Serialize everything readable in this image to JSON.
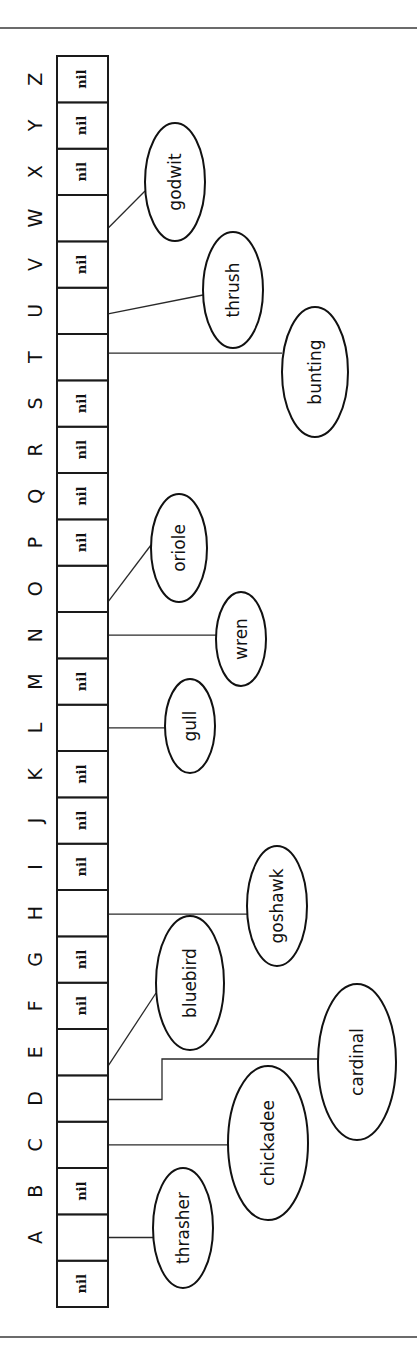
{
  "diagram": {
    "type": "hash-table-buckets",
    "orientation": "rotated-90-ccw",
    "colors": {
      "ink": "#111111",
      "background": "#ffffff"
    },
    "table": {
      "cells": [
        {
          "key": "",
          "value": "nil"
        },
        {
          "key": "A",
          "value": ""
        },
        {
          "key": "B",
          "value": "nil"
        },
        {
          "key": "C",
          "value": ""
        },
        {
          "key": "D",
          "value": ""
        },
        {
          "key": "E",
          "value": ""
        },
        {
          "key": "F",
          "value": "nil"
        },
        {
          "key": "G",
          "value": "nil"
        },
        {
          "key": "H",
          "value": ""
        },
        {
          "key": "I",
          "value": "nil"
        },
        {
          "key": "J",
          "value": "nil"
        },
        {
          "key": "K",
          "value": "nil"
        },
        {
          "key": "L",
          "value": ""
        },
        {
          "key": "M",
          "value": "nil"
        },
        {
          "key": "N",
          "value": ""
        },
        {
          "key": "O",
          "value": ""
        },
        {
          "key": "P",
          "value": "nil"
        },
        {
          "key": "Q",
          "value": "nil"
        },
        {
          "key": "R",
          "value": "nil"
        },
        {
          "key": "S",
          "value": "nil"
        },
        {
          "key": "T",
          "value": ""
        },
        {
          "key": "U",
          "value": ""
        },
        {
          "key": "V",
          "value": "nil"
        },
        {
          "key": "W",
          "value": ""
        },
        {
          "key": "X",
          "value": "nil"
        },
        {
          "key": "Y",
          "value": "nil"
        },
        {
          "key": "Z",
          "value": "nil"
        }
      ]
    },
    "nodes": [
      {
        "name": "thrasher",
        "bucket": "A"
      },
      {
        "name": "chickadee",
        "bucket": "C"
      },
      {
        "name": "cardinal",
        "bucket": "D"
      },
      {
        "name": "bluebird",
        "bucket": "E"
      },
      {
        "name": "goshawk",
        "bucket": "H"
      },
      {
        "name": "gull",
        "bucket": "L"
      },
      {
        "name": "wren",
        "bucket": "N"
      },
      {
        "name": "oriole",
        "bucket": "O"
      },
      {
        "name": "bunting",
        "bucket": "T"
      },
      {
        "name": "thrush",
        "bucket": "U"
      },
      {
        "name": "godwit",
        "bucket": "W"
      }
    ]
  }
}
